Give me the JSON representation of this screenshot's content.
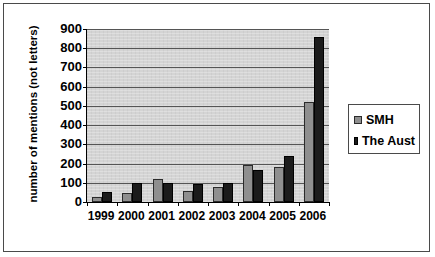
{
  "chart_data": {
    "type": "bar",
    "title": "",
    "xlabel": "",
    "ylabel": "number of mentions (not letters)",
    "ylim": [
      0,
      900
    ],
    "ytick_step": 100,
    "yticks": [
      "900",
      "800",
      "700",
      "600",
      "500",
      "400",
      "300",
      "200",
      "100",
      "0"
    ],
    "grid": true,
    "legend_position": "right",
    "categories": [
      "1999",
      "2000",
      "2001",
      "2002",
      "2003",
      "2004",
      "2005",
      "2006"
    ],
    "series": [
      {
        "name": "SMH",
        "color": "#8f8f8f",
        "values": [
          25,
          45,
          120,
          55,
          80,
          190,
          180,
          520
        ]
      },
      {
        "name": "The Aust",
        "color": "#1b1b1b",
        "values": [
          50,
          100,
          100,
          95,
          100,
          165,
          240,
          860
        ]
      }
    ]
  },
  "legend": {
    "items": [
      {
        "label": "SMH"
      },
      {
        "label": "The Aust"
      }
    ]
  }
}
